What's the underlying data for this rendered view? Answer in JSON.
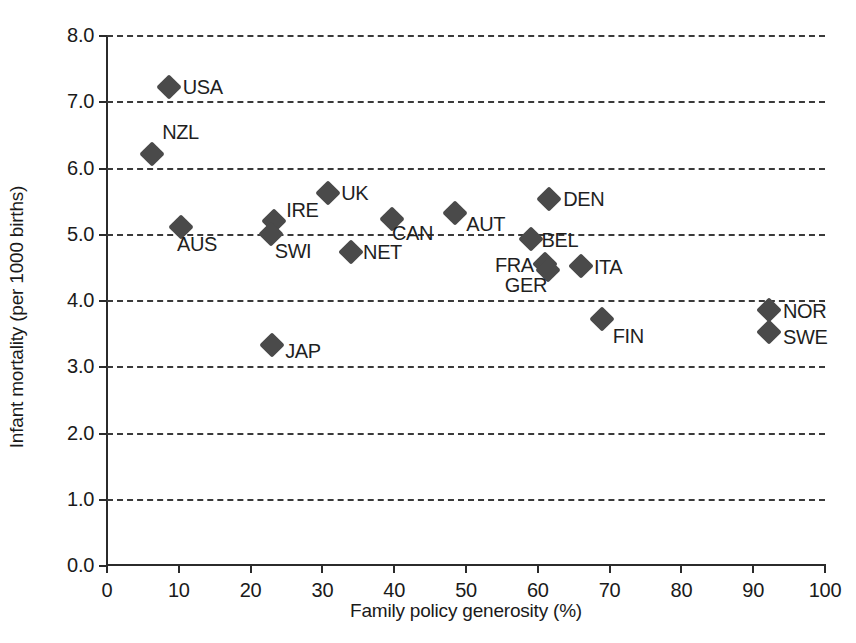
{
  "chart_data": {
    "type": "scatter",
    "title": "",
    "xlabel": "Family policy generosity (%)",
    "ylabel": "Infant mortality (per 1000 births)",
    "xlim": [
      0,
      100
    ],
    "ylim": [
      0.0,
      8.0
    ],
    "xticks": [
      "0",
      "10",
      "20",
      "30",
      "40",
      "50",
      "60",
      "70",
      "80",
      "90",
      "100"
    ],
    "xtick_values": [
      0,
      10,
      20,
      30,
      40,
      50,
      60,
      70,
      80,
      90,
      100
    ],
    "yticks": [
      "0.0",
      "1.0",
      "2.0",
      "3.0",
      "4.0",
      "5.0",
      "6.0",
      "7.0",
      "8.0"
    ],
    "ytick_values": [
      0,
      1,
      2,
      3,
      4,
      5,
      6,
      7,
      8
    ],
    "grid": "horizontal-dashed",
    "legend": "none",
    "marker": "diamond",
    "marker_color": "#4a4a4a",
    "points": [
      {
        "label": "USA",
        "x": 8.6,
        "y": 7.22,
        "lx": 14,
        "ly": -11
      },
      {
        "label": "NZL",
        "x": 6.3,
        "y": 6.2,
        "lx": 10,
        "ly": -33
      },
      {
        "label": "AUS",
        "x": 10.3,
        "y": 5.1,
        "lx": -4,
        "ly": 6
      },
      {
        "label": "IRE",
        "x": 23.3,
        "y": 5.2,
        "lx": 12,
        "ly": -22
      },
      {
        "label": "SWI",
        "x": 22.8,
        "y": 5.0,
        "lx": 4,
        "ly": 6
      },
      {
        "label": "UK",
        "x": 30.8,
        "y": 5.62,
        "lx": 13,
        "ly": -11
      },
      {
        "label": "NET",
        "x": 34.0,
        "y": 4.72,
        "lx": 12,
        "ly": -11
      },
      {
        "label": "CAN",
        "x": 39.7,
        "y": 5.22,
        "lx": 0,
        "ly": 3
      },
      {
        "label": "AUT",
        "x": 48.5,
        "y": 5.32,
        "lx": 11,
        "ly": 0
      },
      {
        "label": "DEN",
        "x": 61.6,
        "y": 5.52,
        "lx": 14,
        "ly": -11
      },
      {
        "label": "BEL",
        "x": 59.0,
        "y": 4.92,
        "lx": 11,
        "ly": -10
      },
      {
        "label": "FRA",
        "x": 61.0,
        "y": 4.55,
        "lx": -50,
        "ly": -10
      },
      {
        "label": "GER",
        "x": 61.4,
        "y": 4.45,
        "lx": -43,
        "ly": 4
      },
      {
        "label": "ITA",
        "x": 66.0,
        "y": 4.52,
        "lx": 13,
        "ly": -10
      },
      {
        "label": "FIN",
        "x": 68.9,
        "y": 3.72,
        "lx": 11,
        "ly": 6
      },
      {
        "label": "NOR",
        "x": 92.2,
        "y": 3.85,
        "lx": 14,
        "ly": -10
      },
      {
        "label": "SWE",
        "x": 92.2,
        "y": 3.52,
        "lx": 14,
        "ly": -6
      },
      {
        "label": "JAP",
        "x": 23.0,
        "y": 3.32,
        "lx": 13,
        "ly": -5
      }
    ]
  }
}
